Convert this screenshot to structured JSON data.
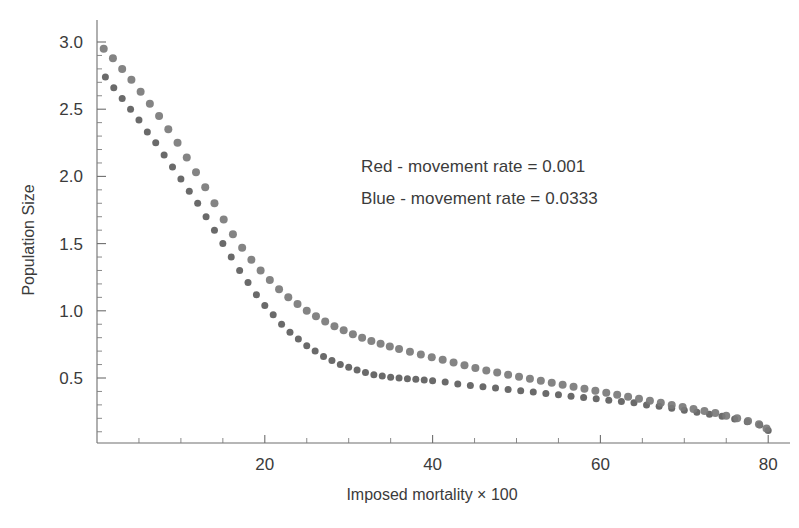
{
  "chart_data": {
    "type": "scatter",
    "title": "",
    "xlabel": "Imposed mortality × 100",
    "ylabel": "Population Size",
    "xlim": [
      0,
      82
    ],
    "ylim": [
      0,
      3.1
    ],
    "grid": false,
    "legend_position": "upper-center-right",
    "xticks": [
      20,
      40,
      60,
      80
    ],
    "xtick_labels": [
      "20",
      "40",
      "60",
      "80"
    ],
    "xtick_minor_step": 5,
    "yticks": [
      0.5,
      1.0,
      1.5,
      2.0,
      2.5,
      3.0
    ],
    "ytick_labels": [
      "0.5",
      "1.0",
      "1.5",
      "2.0",
      "2.5",
      "3.0"
    ],
    "ytick_minor_step": 0.1,
    "marker_color_red": "#5d5d5d",
    "marker_color_blue": "#7a7a7a",
    "axis_color": "#6e6e6e",
    "background": "#ffffff",
    "series": [
      {
        "name": "Red - movement rate = 0.001",
        "legend_label": "Red - movement rate = 0.001",
        "color": "#5d5d5d",
        "marker_size": 7,
        "x": [
          1.0,
          2.0,
          3.0,
          4.0,
          5.0,
          6.0,
          7.0,
          8.0,
          9.0,
          10.0,
          11.0,
          12.0,
          13.0,
          14.0,
          15.0,
          16.0,
          17.0,
          18.0,
          19.0,
          20.0,
          21.0,
          22.0,
          23.0,
          24.0,
          25.0,
          26.0,
          27.0,
          28.0,
          29.0,
          30.0,
          31.0,
          32.0,
          33.0,
          34.0,
          35.0,
          36.0,
          37.0,
          38.0,
          39.0,
          40.0,
          41.5,
          43.0,
          44.5,
          46.0,
          47.5,
          49.0,
          50.5,
          52.0,
          53.5,
          55.0,
          56.5,
          58.0,
          59.5,
          61.0,
          62.5,
          64.0,
          65.5,
          67.0,
          68.5,
          70.0,
          71.5,
          73.0,
          74.5,
          76.0,
          77.5,
          79.0,
          80.0
        ],
        "y": [
          2.74,
          2.66,
          2.58,
          2.5,
          2.42,
          2.33,
          2.25,
          2.16,
          2.07,
          1.98,
          1.89,
          1.8,
          1.7,
          1.6,
          1.5,
          1.4,
          1.3,
          1.21,
          1.12,
          1.04,
          0.97,
          0.9,
          0.84,
          0.79,
          0.74,
          0.7,
          0.66,
          0.63,
          0.6,
          0.58,
          0.56,
          0.54,
          0.525,
          0.515,
          0.505,
          0.5,
          0.495,
          0.49,
          0.485,
          0.48,
          0.47,
          0.455,
          0.445,
          0.435,
          0.425,
          0.415,
          0.405,
          0.395,
          0.385,
          0.375,
          0.365,
          0.355,
          0.345,
          0.335,
          0.325,
          0.315,
          0.3,
          0.29,
          0.275,
          0.26,
          0.245,
          0.23,
          0.215,
          0.195,
          0.175,
          0.15,
          0.11
        ]
      },
      {
        "name": "Blue - movement rate = 0.0333",
        "legend_label": "Blue - movement rate = 0.0333",
        "color": "#7a7a7a",
        "marker_size": 8,
        "x": [
          0.8,
          1.9,
          3.0,
          4.1,
          5.2,
          6.3,
          7.4,
          8.5,
          9.6,
          10.7,
          11.8,
          12.9,
          14.0,
          15.1,
          16.2,
          17.3,
          18.4,
          19.5,
          20.6,
          21.7,
          22.8,
          23.9,
          25.0,
          26.1,
          27.2,
          28.3,
          29.4,
          30.5,
          31.6,
          32.7,
          33.8,
          34.9,
          36.0,
          37.3,
          38.6,
          39.9,
          41.2,
          42.5,
          43.8,
          45.1,
          46.4,
          47.7,
          49.0,
          50.3,
          51.6,
          52.9,
          54.2,
          55.5,
          56.8,
          58.1,
          59.4,
          60.7,
          62.0,
          63.3,
          64.6,
          65.9,
          67.2,
          68.5,
          69.8,
          71.1,
          72.4,
          73.7,
          75.0,
          76.3,
          77.6,
          78.9,
          79.8
        ],
        "y": [
          2.95,
          2.88,
          2.8,
          2.72,
          2.63,
          2.54,
          2.45,
          2.35,
          2.25,
          2.14,
          2.03,
          1.92,
          1.8,
          1.68,
          1.57,
          1.47,
          1.38,
          1.3,
          1.23,
          1.16,
          1.1,
          1.05,
          1.0,
          0.96,
          0.92,
          0.885,
          0.855,
          0.825,
          0.8,
          0.775,
          0.755,
          0.735,
          0.715,
          0.695,
          0.675,
          0.655,
          0.635,
          0.615,
          0.595,
          0.575,
          0.555,
          0.54,
          0.525,
          0.51,
          0.495,
          0.48,
          0.465,
          0.45,
          0.435,
          0.42,
          0.405,
          0.39,
          0.375,
          0.36,
          0.345,
          0.33,
          0.315,
          0.3,
          0.285,
          0.27,
          0.255,
          0.24,
          0.22,
          0.2,
          0.18,
          0.155,
          0.125
        ]
      }
    ]
  },
  "legend": {
    "red_prefix": "Red - movement rate",
    "red_equals": "=",
    "red_value": "0.001",
    "blue_prefix": "Blue - movement rate",
    "blue_equals": "=",
    "blue_value": "0.0333"
  },
  "axes": {
    "x_title": "Imposed mortality × 100",
    "y_title": "Population Size"
  }
}
